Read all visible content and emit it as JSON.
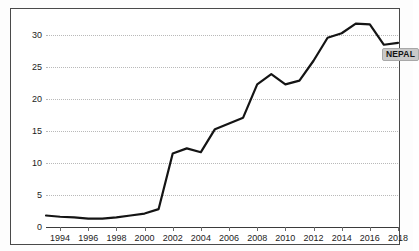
{
  "chart_data": {
    "type": "line",
    "title": "",
    "xlabel": "",
    "ylabel": "",
    "grid": true,
    "legend_position": "inline-end-of-line",
    "xlim": [
      1993,
      2018
    ],
    "ylim": [
      0,
      33
    ],
    "ytick_labels": [
      "0",
      "5",
      "10",
      "15",
      "20",
      "25",
      "30"
    ],
    "ytick_values": [
      0,
      5,
      10,
      15,
      20,
      25,
      30
    ],
    "xtick_labels": [
      "1994",
      "1996",
      "1998",
      "2000",
      "2002",
      "2004",
      "2006",
      "2008",
      "2010",
      "2012",
      "2014",
      "2016",
      "2018"
    ],
    "xtick_values": [
      1994,
      1996,
      1998,
      2000,
      2002,
      2004,
      2006,
      2008,
      2010,
      2012,
      2014,
      2016,
      2018
    ],
    "series": [
      {
        "name": "NEPAL",
        "color": "#141414",
        "x": [
          1993,
          1994,
          1995,
          1996,
          1997,
          1998,
          1999,
          2000,
          2001,
          2002,
          2003,
          2004,
          2005,
          2006,
          2007,
          2008,
          2009,
          2010,
          2011,
          2012,
          2013,
          2014,
          2015,
          2016,
          2017,
          2018
        ],
        "values": [
          1.8,
          1.6,
          1.5,
          1.3,
          1.3,
          1.5,
          1.8,
          2.1,
          2.8,
          11.5,
          12.3,
          11.7,
          15.3,
          16.2,
          17.1,
          22.3,
          23.9,
          22.3,
          22.9,
          26.0,
          29.6,
          30.3,
          31.8,
          31.7,
          28.5,
          28.8
        ]
      }
    ],
    "annotations": [
      {
        "text": "NEPAL",
        "at_x": 2017,
        "at_y": 28.5
      }
    ]
  }
}
